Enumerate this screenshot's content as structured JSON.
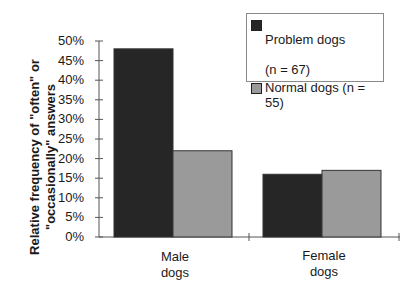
{
  "chart_data": {
    "type": "bar",
    "title": "",
    "xlabel": "",
    "ylabel": "Relative frequency of \"often\" or \"occasionally\" answers",
    "ylabel_lines": [
      "Relative frequency of  \"often\" or",
      "\"occasionally\" answers"
    ],
    "categories": [
      "Male dogs",
      "Female dogs"
    ],
    "category_lines": [
      [
        "Male",
        "dogs"
      ],
      [
        "Female",
        "dogs"
      ]
    ],
    "series": [
      {
        "name": "Problem dogs (n=67)",
        "label_lines": [
          "Problem dogs",
          "(n = 67)"
        ],
        "color": "#262626",
        "values": [
          48,
          16
        ]
      },
      {
        "name": "Normal dogs (n=55)",
        "label_lines": [
          "Normal dogs (n = 55)"
        ],
        "color": "#9a9a9a",
        "values": [
          22,
          17
        ]
      }
    ],
    "yticks": [
      "0%",
      "5%",
      "10%",
      "15%",
      "20%",
      "25%",
      "30%",
      "35%",
      "40%",
      "45%",
      "50%"
    ],
    "ylim": [
      0,
      50
    ],
    "grid": false,
    "legend_position": "upper right"
  }
}
